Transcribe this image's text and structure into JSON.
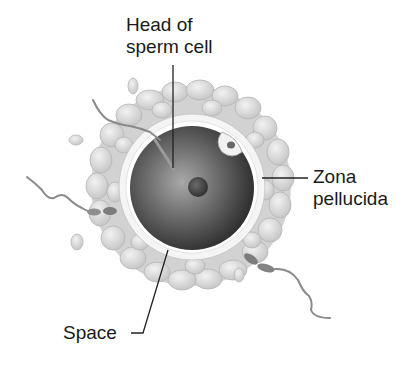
{
  "diagram": {
    "labels": {
      "head_of_sperm": {
        "line1": "Head of",
        "line2": "sperm cell"
      },
      "zona_pellucida": {
        "line1": "Zona",
        "line2": "pellucida"
      },
      "space": {
        "text": "Space"
      }
    },
    "colors": {
      "background": "#ffffff",
      "corona": "#d4d4d4",
      "corona_cell": "#e6e6e6",
      "zona": "#f4f4f4",
      "egg_dark": "#3a3a3a",
      "egg_light": "#8a8a8a",
      "nucleus": "#444444",
      "sperm": "#8c8c8c",
      "leader_line": "#222222",
      "text": "#1a1a1a"
    }
  }
}
